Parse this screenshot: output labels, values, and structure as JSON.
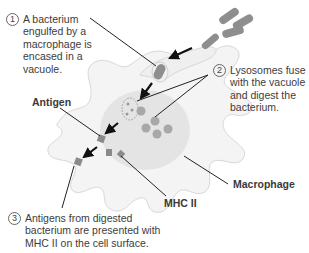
{
  "diagram": {
    "steps": [
      {
        "number": "1",
        "text": "A bacterium engulfed by a macrophage is encased in a vacuole."
      },
      {
        "number": "2",
        "text": "Lysosomes fuse with the vacuole and digest the bacterium."
      },
      {
        "number": "3",
        "text": "Antigens from digested bacterium are presented with MHC II on the cell surface."
      }
    ],
    "labels": {
      "antigen": "Antigen",
      "mhc": "MHC II",
      "macrophage": "Macrophage"
    },
    "colors": {
      "cell_fill": "#f3f3f3",
      "cell_outline": "#d6d6d6",
      "nucleus": "#e0e0e0",
      "bacterium": "#8e8e8e",
      "lysosome": "#a6a6a6",
      "antigen": "#8a8a8a",
      "leader_lines": "#222222"
    }
  }
}
